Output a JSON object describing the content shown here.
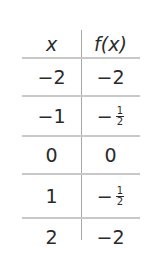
{
  "table": {
    "headers": [
      "x",
      "f(x)"
    ],
    "rows": [
      {
        "x": "−2",
        "fx": "−2",
        "fx_type": "plain"
      },
      {
        "x": "−1",
        "fx_sign": "−",
        "fx_num": "1",
        "fx_den": "2",
        "fx_type": "fraction"
      },
      {
        "x": "0",
        "fx": "0",
        "fx_type": "plain"
      },
      {
        "x": "1",
        "fx_sign": "−",
        "fx_num": "1",
        "fx_den": "2",
        "fx_type": "fraction"
      },
      {
        "x": "2",
        "fx": "−2",
        "fx_type": "plain"
      }
    ]
  }
}
